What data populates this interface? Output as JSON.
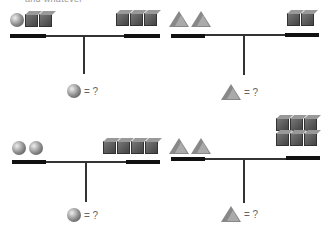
{
  "header": {
    "partial_text": "and whatever"
  },
  "panels": [
    {
      "id": "top-left",
      "left_items": {
        "balls": 1,
        "cubes": 2
      },
      "right_items": {
        "cubes": 3
      },
      "question": {
        "shape": "ball",
        "text": "= ?"
      }
    },
    {
      "id": "top-right",
      "left_items": {
        "triangles": 2
      },
      "right_items": {
        "cubes": 2
      },
      "question": {
        "shape": "triangle",
        "text": "= ?"
      }
    },
    {
      "id": "bottom-left",
      "left_items": {
        "balls": 2
      },
      "right_items": {
        "cubes": 4
      },
      "question": {
        "shape": "ball",
        "text": "= ?"
      }
    },
    {
      "id": "bottom-right",
      "left_items": {
        "triangles": 2
      },
      "right_items": {
        "cubes": 6
      },
      "question": {
        "shape": "triangle",
        "text": "= ?"
      }
    }
  ]
}
